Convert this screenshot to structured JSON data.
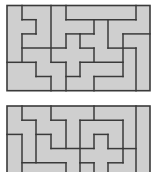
{
  "colors": {
    "background": "#ffffff",
    "fill": "#cfcfcf",
    "stroke": "#3a3a3a"
  },
  "grid": {
    "cols": 10,
    "col_x": [
      7,
      22,
      36,
      51,
      66,
      80,
      94,
      108,
      123,
      136,
      150
    ],
    "row_step": 14.2
  },
  "puzzles": [
    {
      "name": "top-pentomino-tiling",
      "origin_y": 5.5,
      "rows": 6,
      "segments": [
        [
          "V",
          1,
          0,
          1
        ],
        [
          "H",
          1,
          1,
          2
        ],
        [
          "V",
          2,
          1,
          2
        ],
        [
          "H",
          2,
          1,
          2
        ],
        [
          "V",
          1,
          2,
          4
        ],
        [
          "H",
          3,
          1,
          4
        ],
        [
          "H",
          4,
          0,
          2
        ],
        [
          "V",
          2,
          4,
          5
        ],
        [
          "H",
          5,
          2,
          3
        ],
        [
          "V",
          3,
          5,
          6
        ],
        [
          "V",
          3,
          0,
          4
        ],
        [
          "H",
          4,
          3,
          4
        ],
        [
          "V",
          4,
          4,
          6
        ],
        [
          "V",
          4,
          0,
          1
        ],
        [
          "H",
          1,
          4,
          9
        ],
        [
          "V",
          9,
          0,
          1
        ],
        [
          "V",
          6,
          1,
          2
        ],
        [
          "H",
          2,
          5,
          6
        ],
        [
          "V",
          5,
          2,
          3
        ],
        [
          "H",
          2,
          4,
          5
        ],
        [
          "V",
          4,
          2,
          3
        ],
        [
          "H",
          3,
          5,
          6
        ],
        [
          "V",
          6,
          3,
          4
        ],
        [
          "H",
          4,
          5,
          8
        ],
        [
          "V",
          5,
          4,
          5
        ],
        [
          "H",
          5,
          4,
          5
        ],
        [
          "H",
          5,
          6,
          8
        ],
        [
          "V",
          6,
          5,
          6
        ],
        [
          "V",
          7,
          1,
          3
        ],
        [
          "H",
          3,
          7,
          9
        ],
        [
          "V",
          9,
          3,
          6
        ],
        [
          "V",
          8,
          2,
          5
        ],
        [
          "H",
          2,
          8,
          10
        ]
      ]
    },
    {
      "name": "bottom-pentomino-tiling",
      "origin_y": 106,
      "rows": 6,
      "segments": [
        [
          "V",
          1,
          0,
          1
        ],
        [
          "H",
          1,
          1,
          2
        ],
        [
          "V",
          2,
          1,
          4
        ],
        [
          "H",
          4,
          1,
          4
        ],
        [
          "H",
          2,
          0,
          1
        ],
        [
          "V",
          1,
          2,
          6
        ],
        [
          "V",
          3,
          0,
          1
        ],
        [
          "H",
          1,
          3,
          4
        ],
        [
          "V",
          4,
          1,
          3
        ],
        [
          "H",
          2,
          2,
          3
        ],
        [
          "V",
          3,
          2,
          3
        ],
        [
          "H",
          3,
          3,
          6
        ],
        [
          "V",
          4,
          4,
          6
        ],
        [
          "V",
          6,
          0,
          1
        ],
        [
          "H",
          1,
          5,
          8
        ],
        [
          "V",
          5,
          1,
          4
        ],
        [
          "V",
          8,
          1,
          3
        ],
        [
          "H",
          2,
          6,
          7
        ],
        [
          "V",
          6,
          2,
          3
        ],
        [
          "V",
          7,
          2,
          3
        ],
        [
          "H",
          3,
          7,
          9
        ],
        [
          "V",
          8,
          3,
          4
        ],
        [
          "H",
          4,
          5,
          6
        ],
        [
          "H",
          4,
          7,
          8
        ],
        [
          "V",
          5,
          4,
          6
        ],
        [
          "V",
          6,
          4,
          6
        ],
        [
          "V",
          7,
          4,
          6
        ],
        [
          "V",
          9,
          0,
          6
        ]
      ]
    }
  ]
}
